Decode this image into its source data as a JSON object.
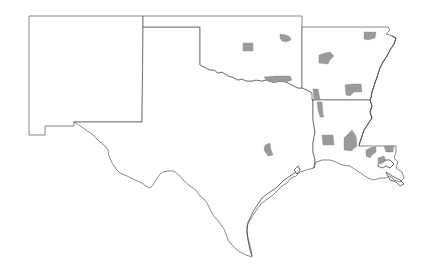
{
  "map": {
    "title": "",
    "states": [
      "New Mexico",
      "Texas",
      "Oklahoma",
      "Arkansas",
      "Louisiana"
    ],
    "colors": {
      "background": "#ffffff",
      "state_fill": "#ffffff",
      "border": "#555555",
      "highlighted_county": "#9a9a9a"
    },
    "highlighted_counties": [
      {
        "state": "Oklahoma",
        "approx_location": "west-central",
        "x": 248,
        "y": 47
      },
      {
        "state": "Oklahoma",
        "approx_location": "north-central",
        "x": 285,
        "y": 37
      },
      {
        "state": "Oklahoma",
        "approx_location": "south along Red River",
        "x": 278,
        "y": 79
      },
      {
        "state": "Arkansas",
        "approx_location": "north",
        "x": 370,
        "y": 35
      },
      {
        "state": "Arkansas",
        "approx_location": "west-central",
        "x": 325,
        "y": 58
      },
      {
        "state": "Arkansas",
        "approx_location": "south-central",
        "x": 353,
        "y": 89
      },
      {
        "state": "Arkansas",
        "approx_location": "southwest corner",
        "x": 317,
        "y": 94
      },
      {
        "state": "Louisiana",
        "approx_location": "northwest",
        "x": 321,
        "y": 110
      },
      {
        "state": "Louisiana",
        "approx_location": "west-central",
        "x": 329,
        "y": 139
      },
      {
        "state": "Louisiana",
        "approx_location": "central",
        "x": 351,
        "y": 145
      },
      {
        "state": "Louisiana",
        "approx_location": "east",
        "x": 372,
        "y": 152
      },
      {
        "state": "Louisiana",
        "approx_location": "northeast of delta",
        "x": 390,
        "y": 147
      },
      {
        "state": "Louisiana",
        "approx_location": "south-east",
        "x": 382,
        "y": 163
      },
      {
        "state": "Texas",
        "approx_location": "central",
        "x": 268,
        "y": 149
      }
    ]
  }
}
